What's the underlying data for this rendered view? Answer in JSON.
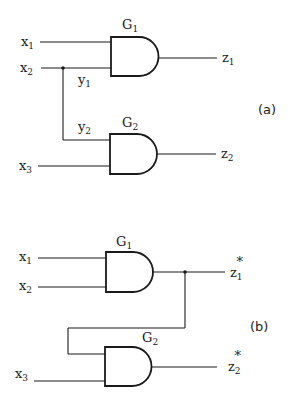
{
  "diagram_a": {
    "tag": "(a)",
    "gates": [
      {
        "id": "G1",
        "name": "G",
        "sub": "1",
        "type": "AND"
      },
      {
        "id": "G2",
        "name": "G",
        "sub": "2",
        "type": "AND"
      }
    ],
    "inputs": [
      {
        "name": "x",
        "sub": "1"
      },
      {
        "name": "x",
        "sub": "2"
      },
      {
        "name": "x",
        "sub": "3"
      }
    ],
    "branch_labels": [
      {
        "name": "y",
        "sub": "1"
      },
      {
        "name": "y",
        "sub": "2"
      }
    ],
    "outputs": [
      {
        "name": "z",
        "sub": "1",
        "sup": ""
      },
      {
        "name": "z",
        "sub": "2",
        "sup": ""
      }
    ]
  },
  "diagram_b": {
    "tag": "(b)",
    "gates": [
      {
        "id": "G1",
        "name": "G",
        "sub": "1",
        "type": "AND"
      },
      {
        "id": "G2",
        "name": "G",
        "sub": "2",
        "type": "AND"
      }
    ],
    "inputs": [
      {
        "name": "x",
        "sub": "1"
      },
      {
        "name": "x",
        "sub": "2"
      },
      {
        "name": "x",
        "sub": "3"
      }
    ],
    "outputs": [
      {
        "name": "z",
        "sub": "1",
        "sup": "*"
      },
      {
        "name": "z",
        "sub": "2",
        "sup": "*"
      }
    ]
  }
}
